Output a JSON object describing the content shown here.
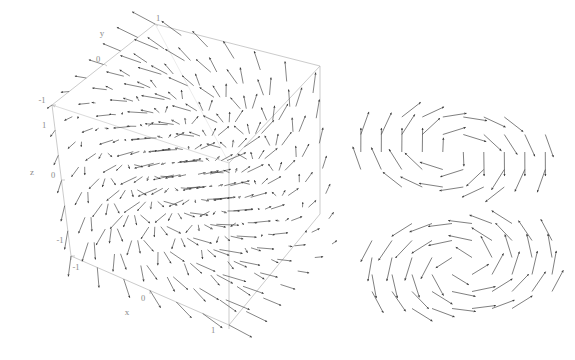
{
  "figure": {
    "background": "#ffffff",
    "frame_color": "#b5b5b5",
    "arrow_color": "#3a3a3a",
    "label_color": "#8a8a8a",
    "panels": [
      {
        "name": "3d-vector-field",
        "type": "vector-field-3d"
      },
      {
        "name": "2d-vector-field-top",
        "type": "vector-field-2d"
      },
      {
        "name": "2d-vector-field-bottom",
        "type": "vector-field-2d"
      }
    ]
  },
  "chart_data": {
    "type": "scatter",
    "title": "",
    "subtitle": "",
    "xlabel": "x",
    "ylabel": "y",
    "zlabel": "z",
    "xlim": [
      -1,
      1
    ],
    "ylim": [
      -1,
      1
    ],
    "zlim": [
      -1,
      1
    ],
    "grid": false,
    "legend": null,
    "axes": {
      "x": {
        "label": "x",
        "ticks": [
          -1,
          0,
          1
        ],
        "ticklabels": [
          "-1",
          "0",
          "1"
        ]
      },
      "y": {
        "label": "y",
        "ticks": [
          -1,
          0,
          1
        ],
        "ticklabels": [
          "-1",
          "0",
          "1"
        ]
      },
      "z": {
        "label": "z",
        "ticks": [
          -1,
          0,
          1
        ],
        "ticklabels": [
          "-1",
          "0",
          "1"
        ]
      }
    },
    "field_3d": {
      "description": "3D vector field of arrows sampled on a regular grid inside the unit cube",
      "samples_per_axis": 7,
      "vector_function": "rotational-radial",
      "arrow_count": 343
    },
    "field_2d_top": {
      "description": "2D rotational (vortex) vector field slice, counter-clockwise",
      "grid_cols": 9,
      "grid_rows": 5,
      "arrow_count": 45
    },
    "field_2d_bottom": {
      "description": "2D rotational (vortex) vector field slice, clockwise",
      "grid_cols": 9,
      "grid_rows": 6,
      "arrow_count": 54
    }
  },
  "labels": {
    "x_axis": "x",
    "y_axis": "y",
    "z_axis": "z",
    "x_tick_neg1": "-1",
    "x_tick_0": "0",
    "x_tick_1": "1",
    "y_tick_neg1": "-1",
    "y_tick_0": "0",
    "y_tick_1": "1",
    "z_tick_neg1": "-1",
    "z_tick_0": "0",
    "z_tick_1": "1"
  }
}
